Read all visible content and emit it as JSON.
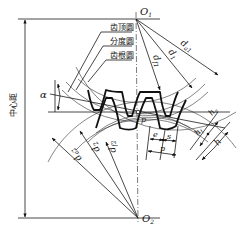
{
  "diagram": {
    "callouts": {
      "addendum_circle": "齿顶圆",
      "pitch_circle": "分度圆",
      "dedendum_circle": "齿根圆"
    },
    "center_distance_label": "中心距",
    "centers": {
      "upper": "O",
      "upper_sub": "1",
      "lower": "O",
      "lower_sub": "2"
    },
    "upper_gear_diameters": {
      "tip": "d",
      "tip_sub": "a1",
      "pitch": "d",
      "pitch_sub": "1",
      "root": "d",
      "root_sub": "f1"
    },
    "lower_gear_diameters": {
      "tip": "d",
      "tip_sub": "a2",
      "pitch": "d",
      "pitch_sub": "2",
      "root": "d",
      "root_sub": "f2"
    },
    "pressure_angle": "α",
    "pitch_point": "p",
    "tooth_dims": {
      "space_width": "e",
      "tooth_thickness": "s",
      "pitch": "p",
      "addendum": "h",
      "addendum_sub": "a",
      "dedendum": "h",
      "dedendum_sub": "f",
      "whole_depth": "h"
    }
  }
}
